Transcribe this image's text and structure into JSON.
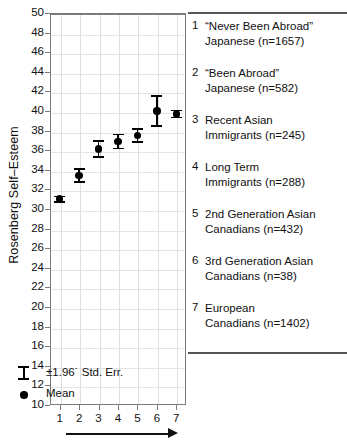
{
  "chart_data": {
    "type": "scatter",
    "title": "",
    "xlabel": "",
    "ylabel": "Rosenberg Self–Esteem",
    "ylim": [
      10,
      50
    ],
    "ytick_step": 2,
    "yticks": [
      50,
      48,
      46,
      44,
      42,
      40,
      38,
      36,
      34,
      32,
      30,
      28,
      26,
      24,
      22,
      20,
      18,
      16,
      14,
      12,
      10
    ],
    "xticks": [
      1,
      2,
      3,
      4,
      5,
      6,
      7
    ],
    "xlim": [
      0.5,
      7.5
    ],
    "grid": true,
    "legend_position": "right",
    "error_type": "±1.96 * Std. Err.",
    "categories": [
      1,
      2,
      3,
      4,
      5,
      6,
      7
    ],
    "values": [
      31.0,
      33.4,
      36.1,
      36.9,
      37.5,
      40.0,
      39.7
    ],
    "errors": [
      0.35,
      0.75,
      0.9,
      0.8,
      0.75,
      1.6,
      0.45
    ],
    "series": [
      {
        "name": "Mean",
        "points": [
          {
            "x": 1,
            "y": 31.0,
            "err": 0.35,
            "group": "“Never Been Abroad” Japanese",
            "n": 1657
          },
          {
            "x": 2,
            "y": 33.4,
            "err": 0.75,
            "group": "“Been Abroad” Japanese",
            "n": 582
          },
          {
            "x": 3,
            "y": 36.1,
            "err": 0.9,
            "group": "Recent Asian Immigrants",
            "n": 245
          },
          {
            "x": 4,
            "y": 36.9,
            "err": 0.8,
            "group": "Long Term Immigrants",
            "n": 288
          },
          {
            "x": 5,
            "y": 37.5,
            "err": 0.75,
            "group": "2nd Generation Asian Canadians",
            "n": 432
          },
          {
            "x": 6,
            "y": 40.0,
            "err": 1.6,
            "group": "3rd Generation Asian Canadians",
            "n": 38
          },
          {
            "x": 7,
            "y": 39.7,
            "err": 0.45,
            "group": "European Canadians",
            "n": 1402
          }
        ]
      }
    ]
  },
  "axis": {
    "y_title": "Rosenberg Self–Esteem",
    "y_labels": [
      "50",
      "48",
      "46",
      "44",
      "42",
      "40",
      "38",
      "36",
      "34",
      "32",
      "30",
      "28",
      "26",
      "24",
      "22",
      "20",
      "18",
      "16",
      "14",
      "12",
      "10"
    ],
    "x_labels": [
      "1",
      "2",
      "3",
      "4",
      "5",
      "6",
      "7"
    ]
  },
  "legend": {
    "entries": [
      {
        "num": "1",
        "text": "“Never Been Abroad”\nJapanese (n=1657)"
      },
      {
        "num": "2",
        "text": "“Been Abroad”\nJapanese (n=582)"
      },
      {
        "num": "3",
        "text": "Recent Asian\nImmigrants (n=245)"
      },
      {
        "num": "4",
        "text": "Long Term\nImmigrants (n=288)"
      },
      {
        "num": "5",
        "text": "2nd Generation Asian\nCanadians (n=432)"
      },
      {
        "num": "6",
        "text": "3rd Generation Asian\nCanadians (n=38)"
      },
      {
        "num": "7",
        "text": "European\nCanadians (n=1402)"
      }
    ],
    "key": {
      "errorbar_label": "±1.96˙ Std. Err.",
      "mean_label": "Mean"
    }
  },
  "colors": {
    "marker": "#000000",
    "axis": "#7b7b7b",
    "grid": "#dedede",
    "rule": "#555555",
    "text": "#111111",
    "background": "#ffffff"
  }
}
